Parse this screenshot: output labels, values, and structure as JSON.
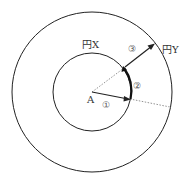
{
  "diagram": {
    "labels": {
      "center": "A",
      "inner_circle": "円X",
      "outer_circle": "円Y",
      "step1": "①",
      "step2": "②",
      "step3": "③"
    },
    "geometry": {
      "center": [
        92,
        92
      ],
      "inner_radius": 39,
      "outer_radius": 80
    },
    "colors": {
      "line": "#222222",
      "dotted": "#777777"
    }
  }
}
